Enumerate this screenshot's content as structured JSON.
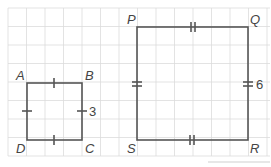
{
  "figure": {
    "small_square": {
      "vertices": {
        "A": "A",
        "B": "B",
        "C": "C",
        "D": "D"
      },
      "side_label": "3",
      "tick_marks": "single"
    },
    "large_square": {
      "vertices": {
        "P": "P",
        "Q": "Q",
        "R": "R",
        "S": "S"
      },
      "side_label": "6",
      "tick_marks": "double"
    },
    "grid": {
      "cell_size_px": 18.5,
      "color": "#d8d8d8"
    },
    "stroke_color": "#555555"
  }
}
